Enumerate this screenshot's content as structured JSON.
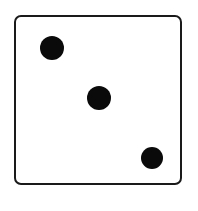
{
  "die": {
    "face_value": 3,
    "pips": [
      {
        "cx": 52,
        "cy": 48,
        "r": 12
      },
      {
        "cx": 99,
        "cy": 98,
        "r": 12
      },
      {
        "cx": 152,
        "cy": 158,
        "r": 11
      }
    ],
    "colors": {
      "outline": "#1a1a1a",
      "pip": "#0a0a0a",
      "background": "#ffffff"
    }
  }
}
